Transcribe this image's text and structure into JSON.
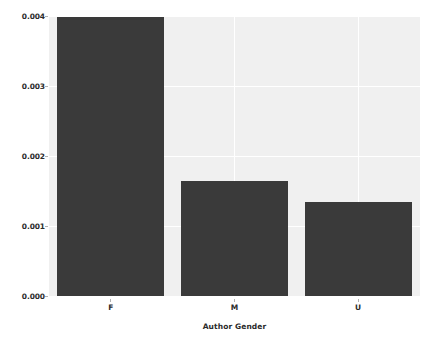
{
  "chart_data": {
    "type": "bar",
    "title": "",
    "xlabel": "Author Gender",
    "ylabel": "Mean Proportion",
    "categories": [
      "F",
      "M",
      "U"
    ],
    "values": [
      0.00399,
      0.00164,
      0.00135
    ],
    "series": [
      {
        "name": "Mean Proportion",
        "values": [
          0.00399,
          0.00164,
          0.00135
        ]
      }
    ],
    "ylim": [
      0.0,
      0.004
    ],
    "yticks": [
      0.0,
      0.001,
      0.002,
      0.003,
      0.004
    ],
    "ytick_labels": [
      "0.000",
      "0.001",
      "0.002",
      "0.003",
      "0.004"
    ],
    "xtick_labels": [
      "F",
      "M",
      "U"
    ],
    "grid": true,
    "grid_axis": "both",
    "legend": false,
    "legend_position": "none",
    "bar_color": "#3a3a3a",
    "plot_background": "#f0f0f0",
    "figure_background": "#ffffff",
    "gridline_color": "#ffffff",
    "text_color": "#2b2b2b"
  },
  "axes": {
    "y_title": "Mean Proportion",
    "x_title": "Author Gender"
  }
}
